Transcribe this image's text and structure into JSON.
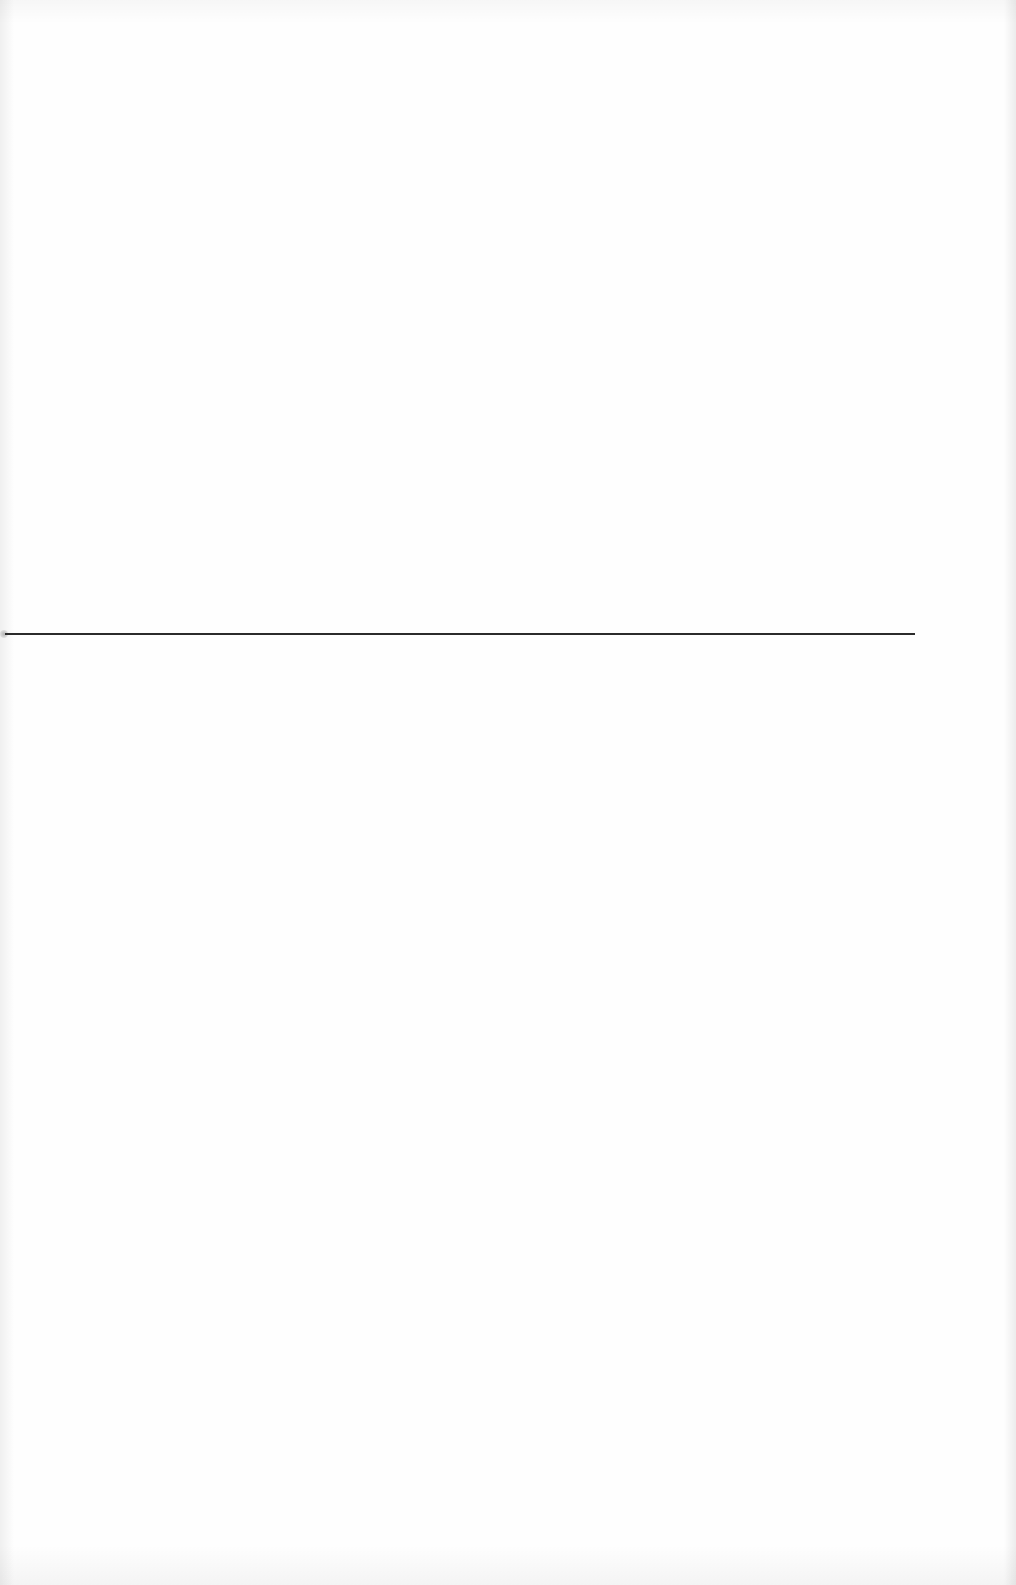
{
  "document": {
    "type": "scanned-page",
    "background_color": "#fefefe",
    "rule": {
      "color": "#2b2b2b",
      "y": 634,
      "x_start": 5,
      "x_end": 915,
      "thickness": 2
    },
    "text": ""
  }
}
